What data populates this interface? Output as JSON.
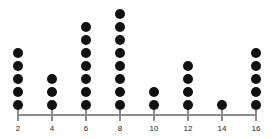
{
  "chart_data": {
    "type": "dot-plot",
    "title": "",
    "subtitle": "",
    "xlabel": "",
    "ylabel": "",
    "categories": [
      2,
      4,
      6,
      8,
      10,
      12,
      14,
      16
    ],
    "tick_labels": [
      "2",
      "4",
      "6",
      "8",
      "10",
      "12",
      "14",
      "16"
    ],
    "values": [
      5,
      3,
      7,
      8,
      2,
      4,
      1,
      5
    ],
    "series": [
      {
        "name": "count",
        "values": [
          5,
          3,
          7,
          8,
          2,
          4,
          1,
          5
        ]
      }
    ],
    "xlim": [
      2,
      16
    ],
    "ylim": [
      0,
      8
    ],
    "grid": false,
    "legend": null,
    "total_dots": 35,
    "annotations": []
  },
  "style": {
    "dot_color": "#111111",
    "axis_color": "#8c8c8c",
    "label_color": "#1a1a1a",
    "background": "#ffffff"
  },
  "geometry": {
    "axis_left": 18,
    "axis_right": 257,
    "axis_y": 114,
    "tick_spacing": 34,
    "dot_diameter": 10,
    "dot_pitch": 13,
    "baseline_y": 100
  }
}
